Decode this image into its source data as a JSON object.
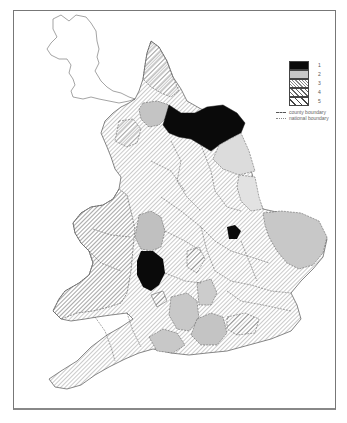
{
  "map": {
    "title": "",
    "region": "England and Wales, by county",
    "classes": [
      {
        "id": 1,
        "label": "1",
        "fill": "solid-black",
        "color": "#0a0a0a"
      },
      {
        "id": 2,
        "label": "2",
        "fill": "solid-grey",
        "color": "#c8c8c8"
      },
      {
        "id": 3,
        "label": "3",
        "fill": "fine-hatch",
        "color": "#9a9a9a"
      },
      {
        "id": 4,
        "label": "4",
        "fill": "medium-hatch",
        "color": "#666666"
      },
      {
        "id": 5,
        "label": "5",
        "fill": "wide-hatch",
        "color": "#444444"
      }
    ],
    "boundary_legend": [
      {
        "style": "dashed",
        "label": "county boundary"
      },
      {
        "style": "dotted",
        "label": "national boundary"
      }
    ]
  }
}
